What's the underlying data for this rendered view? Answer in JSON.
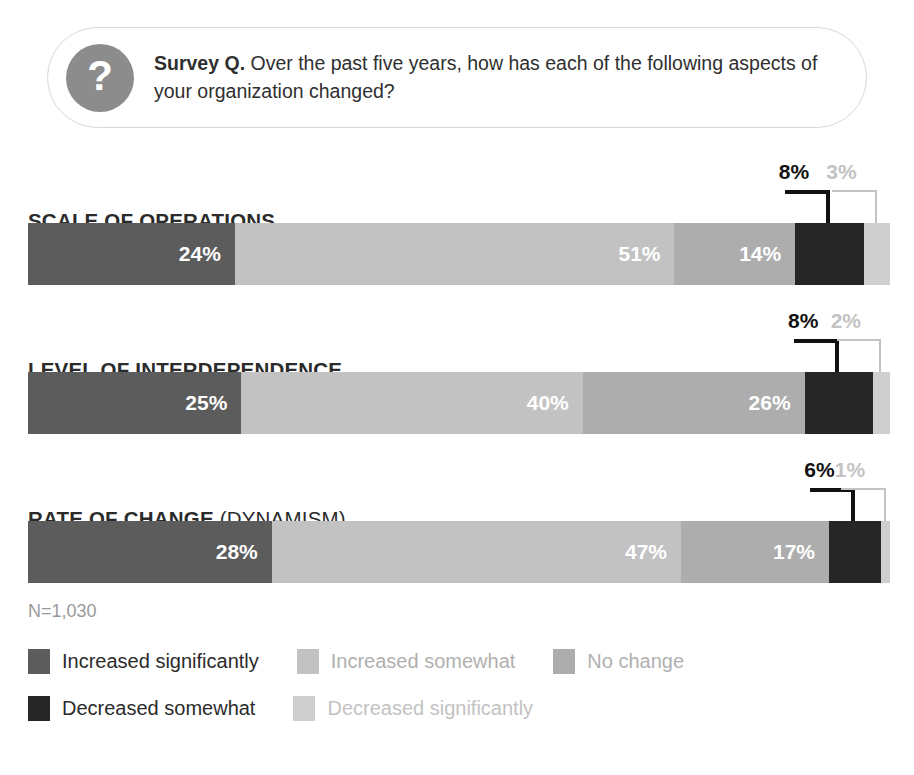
{
  "question": {
    "badge_icon": "question-mark-icon",
    "badge_glyph": "?",
    "lead": "Survey Q.",
    "body": " Over the past five years, how has each of the following aspects of your organization changed?"
  },
  "footer": {
    "sample_note": "N=1,030"
  },
  "chart_data": {
    "type": "bar",
    "subtype": "stacked-horizontal-100",
    "title": "Over the past five years, how has each of the following aspects of your organization changed?",
    "xlabel": "",
    "ylabel": "",
    "xlim": [
      0,
      100
    ],
    "grid": false,
    "legend_position": "bottom",
    "sample_size": "N=1,030",
    "categories": [
      "SCALE OF OPERATIONS",
      "LEVEL OF INTERDEPENDENCE",
      "RATE OF CHANGE (DYNAMISM)"
    ],
    "series": [
      {
        "name": "Increased significantly",
        "color": "#5c5c5c",
        "values": [
          24,
          25,
          28
        ]
      },
      {
        "name": "Increased somewhat",
        "color": "#c2c2c2",
        "values": [
          51,
          40,
          47
        ]
      },
      {
        "name": "No change",
        "color": "#adadad",
        "values": [
          14,
          26,
          17
        ]
      },
      {
        "name": "Decreased somewhat",
        "color": "#262626",
        "values": [
          8,
          8,
          6
        ]
      },
      {
        "name": "Decreased significantly",
        "color": "#cfcfcf",
        "values": [
          3,
          2,
          1
        ]
      }
    ]
  },
  "bars": [
    {
      "label_main": "SCALE OF OPERATIONS",
      "label_sub": "",
      "segments": [
        {
          "series": "Increased significantly",
          "value": 24,
          "label": "24%",
          "color": "#5c5c5c",
          "label_visible": true
        },
        {
          "series": "Increased somewhat",
          "value": 51,
          "label": "51%",
          "color": "#c2c2c2",
          "label_visible": true
        },
        {
          "series": "No change",
          "value": 14,
          "label": "14%",
          "color": "#adadad",
          "label_visible": true
        },
        {
          "series": "Decreased somewhat",
          "value": 8,
          "label": "8%",
          "color": "#262626",
          "label_visible": false
        },
        {
          "series": "Decreased significantly",
          "value": 3,
          "label": "3%",
          "color": "#cfcfcf",
          "label_visible": false
        }
      ],
      "callouts": [
        {
          "label": "8%",
          "color": "#111111",
          "series": "Decreased somewhat"
        },
        {
          "label": "3%",
          "color": "#c3c3c3",
          "series": "Decreased significantly"
        }
      ]
    },
    {
      "label_main": "LEVEL OF INTERDEPENDENCE",
      "label_sub": "",
      "segments": [
        {
          "series": "Increased significantly",
          "value": 25,
          "label": "25%",
          "color": "#5c5c5c",
          "label_visible": true
        },
        {
          "series": "Increased somewhat",
          "value": 40,
          "label": "40%",
          "color": "#c2c2c2",
          "label_visible": true
        },
        {
          "series": "No change",
          "value": 26,
          "label": "26%",
          "color": "#adadad",
          "label_visible": true
        },
        {
          "series": "Decreased somewhat",
          "value": 8,
          "label": "8%",
          "color": "#262626",
          "label_visible": false
        },
        {
          "series": "Decreased significantly",
          "value": 2,
          "label": "2%",
          "color": "#cfcfcf",
          "label_visible": false
        }
      ],
      "callouts": [
        {
          "label": "8%",
          "color": "#111111",
          "series": "Decreased somewhat"
        },
        {
          "label": "2%",
          "color": "#c3c3c3",
          "series": "Decreased significantly"
        }
      ]
    },
    {
      "label_main": "RATE OF CHANGE",
      "label_sub": " (DYNAMISM)",
      "segments": [
        {
          "series": "Increased significantly",
          "value": 28,
          "label": "28%",
          "color": "#5c5c5c",
          "label_visible": true
        },
        {
          "series": "Increased somewhat",
          "value": 47,
          "label": "47%",
          "color": "#c2c2c2",
          "label_visible": true
        },
        {
          "series": "No change",
          "value": 17,
          "label": "17%",
          "color": "#adadad",
          "label_visible": true
        },
        {
          "series": "Decreased somewhat",
          "value": 6,
          "label": "6%",
          "color": "#262626",
          "label_visible": false
        },
        {
          "series": "Decreased significantly",
          "value": 1,
          "label": "1%",
          "color": "#cfcfcf",
          "label_visible": false
        }
      ],
      "callouts": [
        {
          "label": "6%",
          "color": "#111111",
          "series": "Decreased somewhat"
        },
        {
          "label": "1%",
          "color": "#c3c3c3",
          "series": "Decreased significantly"
        }
      ]
    }
  ],
  "legend": {
    "rows": [
      [
        {
          "label": "Increased significantly",
          "color": "#5c5c5c",
          "text_color": "#2b2b2b"
        },
        {
          "label": "Increased somewhat",
          "color": "#c2c2c2",
          "text_color": "#b0b0b0"
        },
        {
          "label": "No change",
          "color": "#adadad",
          "text_color": "#b0b0b0"
        }
      ],
      [
        {
          "label": "Decreased somewhat",
          "color": "#262626",
          "text_color": "#2b2b2b"
        },
        {
          "label": "Decreased significantly",
          "color": "#cfcfcf",
          "text_color": "#c2c2c2"
        }
      ]
    ]
  }
}
